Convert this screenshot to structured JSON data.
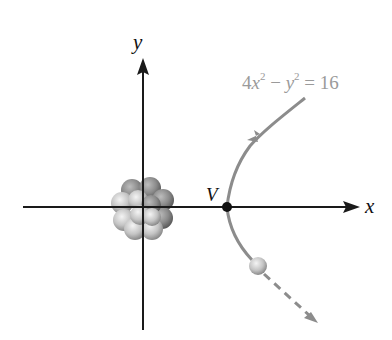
{
  "diagram": {
    "equation": {
      "coef": "4",
      "var1": "x",
      "exp1": "2",
      "minus": " − ",
      "var2": "y",
      "exp2": "2",
      "rhs": " = 16"
    },
    "axes": {
      "x_label": "x",
      "y_label": "y"
    },
    "vertex_label": "V",
    "elements": {
      "nucleus": "cluster of spheres at origin",
      "particle": "small sphere on lower branch of hyperbola",
      "path": "right branch of hyperbola 4x^2 - y^2 = 16 with incoming arrow on upper branch and dashed outgoing continuation"
    },
    "colors": {
      "axis": "#1a1a1a",
      "curve": "#8c8c8c",
      "equation_text": "#9a9a9a",
      "vertex_dot": "#111111"
    }
  }
}
